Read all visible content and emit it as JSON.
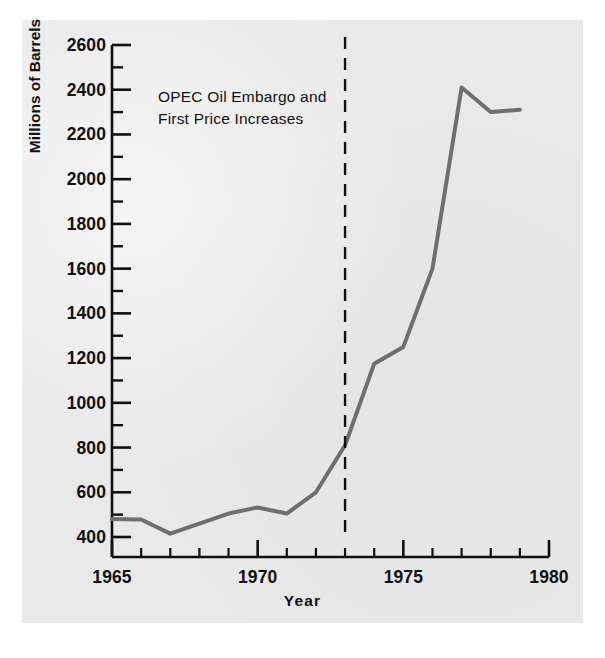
{
  "chart_data": {
    "type": "line",
    "title": "",
    "subtitle": "",
    "xlabel": "Year",
    "ylabel": "Millions of Barrels",
    "xlim": [
      1965,
      1980
    ],
    "ylim": [
      370,
      2600
    ],
    "grid": false,
    "legend": null,
    "x_major_ticks": [
      1965,
      1970,
      1975,
      1980
    ],
    "x_major_tick_labels": [
      "1965",
      "1970",
      "1975",
      "1980"
    ],
    "x_minor_tick_step": 1,
    "y_major_ticks": [
      400,
      600,
      800,
      1000,
      1200,
      1400,
      1600,
      1800,
      2000,
      2200,
      2400,
      2600
    ],
    "y_major_tick_labels": [
      "400",
      "600",
      "800",
      "1000",
      "1200",
      "1400",
      "1600",
      "1800",
      "2000",
      "2200",
      "2400",
      "2600"
    ],
    "y_minor_tick_step": 100,
    "series": [
      {
        "name": "U.S. Crude Oil Imports",
        "color": "#6f6f6f",
        "x": [
          1965,
          1966,
          1967,
          1968,
          1969,
          1970,
          1971,
          1972,
          1973,
          1974,
          1975,
          1976,
          1977,
          1978,
          1979
        ],
        "values": [
          480,
          478,
          415,
          460,
          505,
          532,
          505,
          600,
          810,
          1175,
          1250,
          1600,
          2410,
          2300,
          2310
        ]
      }
    ],
    "annotations": [
      {
        "name": "opec-embargo-marker",
        "type": "vline",
        "x": 1973,
        "style": "dashed",
        "color": "#101010",
        "text_lines": [
          "OPEC Oil Embargo and",
          "First Price Increases"
        ]
      }
    ]
  },
  "colors": {
    "background": "#e9e9e9",
    "page": "#ffffff",
    "axis": "#101010",
    "text": "#111111",
    "series": "#6f6f6f",
    "annotation": "#101010"
  }
}
